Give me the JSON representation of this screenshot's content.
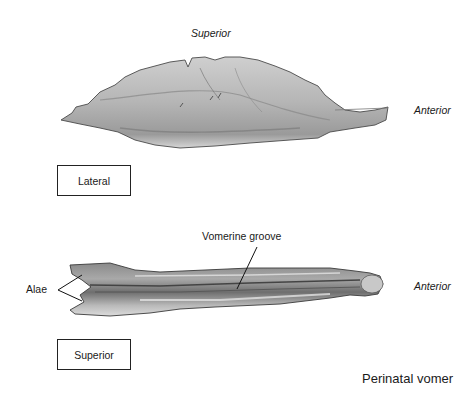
{
  "figure": {
    "title": "Perinatal vomer",
    "lateral_view": {
      "view_label": "Lateral",
      "orientation_top": "Superior",
      "orientation_right": "Anterior"
    },
    "superior_view": {
      "view_label": "Superior",
      "orientation_right": "Anterior",
      "callouts": [
        {
          "label": "Vomerine groove"
        },
        {
          "label": "Alae"
        }
      ]
    }
  },
  "colors": {
    "bone_light": "#d9d9d9",
    "bone_mid": "#a8a8a8",
    "bone_dark": "#5a5a5a",
    "line": "#222222"
  }
}
